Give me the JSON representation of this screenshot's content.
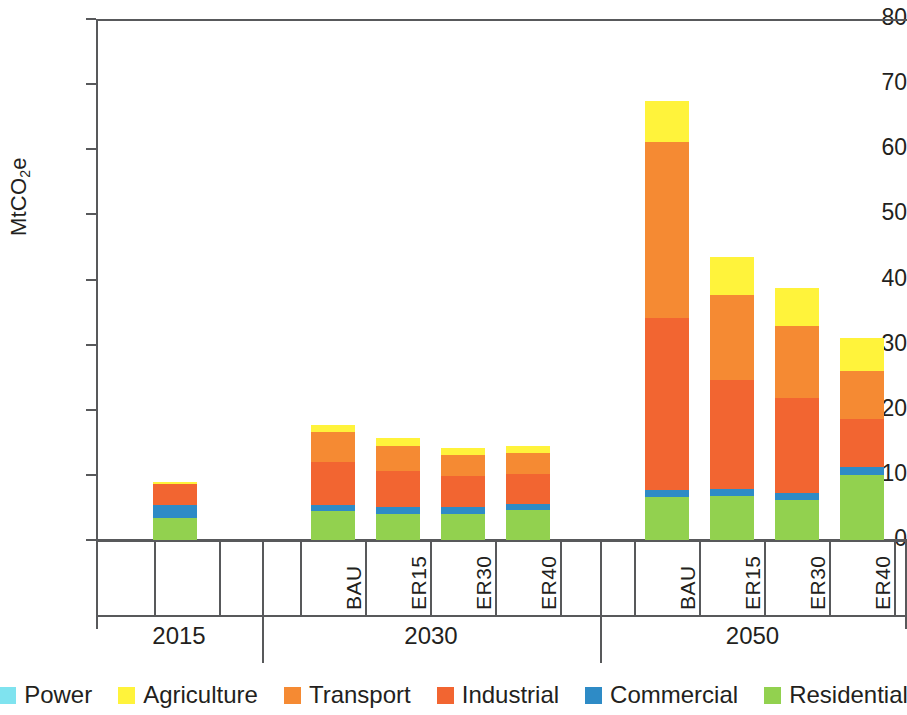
{
  "chart_data": {
    "type": "bar",
    "title": "",
    "subtitle": "",
    "xlabel": "",
    "ylabel": "MtCO2e",
    "ylabel_rich": {
      "pre": "MtCO",
      "sub": "2",
      "post": "e"
    },
    "ylim": [
      0,
      80
    ],
    "yticks": [
      0,
      10,
      20,
      30,
      40,
      50,
      60,
      70,
      80
    ],
    "ytick_labels": [
      "0",
      "10",
      "20",
      "30",
      "40",
      "50",
      "60",
      "70",
      "80"
    ],
    "grid": false,
    "stacked": true,
    "legend_position": "bottom",
    "groups": [
      {
        "label": "2015",
        "scenarios": [
          ""
        ]
      },
      {
        "label": "2030",
        "scenarios": [
          "BAU",
          "ER15",
          "ER30",
          "ER40"
        ]
      },
      {
        "label": "2050",
        "scenarios": [
          "BAU",
          "ER15",
          "ER30",
          "ER40"
        ]
      }
    ],
    "categories": [
      "2015",
      "2030 BAU",
      "2030 ER15",
      "2030 ER30",
      "2030 ER40",
      "2050 BAU",
      "2050 ER15",
      "2050 ER30",
      "2050 ER40"
    ],
    "series": [
      {
        "name": "Power",
        "color": "#7fe3ef",
        "values": [
          0.0,
          0.0,
          0.0,
          0.0,
          0.0,
          0.0,
          0.0,
          0.0,
          0.0
        ]
      },
      {
        "name": "Agriculture",
        "color": "#fff33b",
        "values": [
          0.3,
          1.1,
          1.1,
          1.1,
          1.1,
          6.3,
          5.7,
          5.9,
          5.0
        ]
      },
      {
        "name": "Transport",
        "color": "#f58a33",
        "values": [
          0.0,
          4.6,
          3.9,
          3.2,
          3.3,
          27.0,
          13.2,
          11.0,
          7.4
        ]
      },
      {
        "name": "Industrial",
        "color": "#f26531",
        "values": [
          3.2,
          6.6,
          5.6,
          4.9,
          4.5,
          26.4,
          16.7,
          14.6,
          7.4
        ]
      },
      {
        "name": "Commercial",
        "color": "#2e8bc6",
        "values": [
          2.0,
          0.9,
          1.0,
          1.0,
          1.0,
          1.1,
          1.1,
          1.1,
          1.2
        ]
      },
      {
        "name": "Residential",
        "color": "#92d14f",
        "values": [
          3.4,
          4.5,
          4.0,
          4.0,
          4.6,
          6.6,
          6.7,
          6.1,
          10.0
        ]
      }
    ],
    "totals": [
      8.9,
      17.7,
      15.6,
      14.2,
      14.5,
      67.4,
      43.4,
      38.7,
      31.0
    ]
  },
  "legend": {
    "items": [
      {
        "label": "Power",
        "color": "#7fe3ef",
        "swatch_name": "legend-swatch-power"
      },
      {
        "label": "Agriculture",
        "color": "#fff33b",
        "swatch_name": "legend-swatch-agriculture"
      },
      {
        "label": "Transport",
        "color": "#f58a33",
        "swatch_name": "legend-swatch-transport"
      },
      {
        "label": "Industrial",
        "color": "#f26531",
        "swatch_name": "legend-swatch-industrial"
      },
      {
        "label": "Commercial",
        "color": "#2e8bc6",
        "swatch_name": "legend-swatch-commercial"
      },
      {
        "label": "Residential",
        "color": "#92d14f",
        "swatch_name": "legend-swatch-residential"
      }
    ]
  }
}
